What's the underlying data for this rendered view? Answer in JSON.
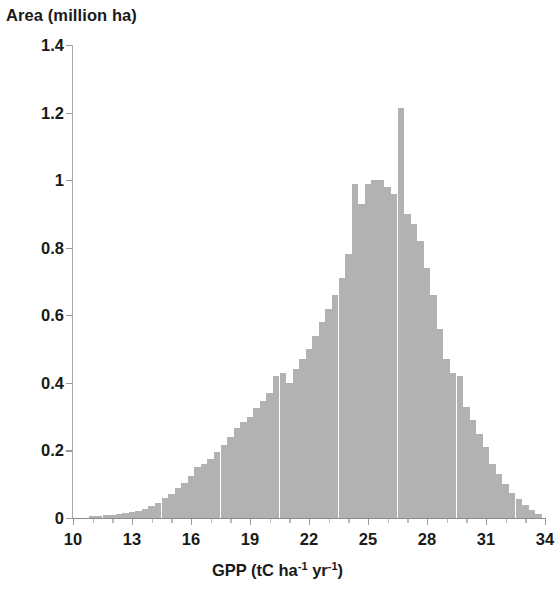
{
  "chart_data": {
    "type": "bar",
    "title": "",
    "subtitle": "",
    "ylabel": "Area (million ha)",
    "xlabel_parts": {
      "prefix": "GPP (tC ha",
      "sup1": "-1",
      "middle": " yr",
      "sup2": "-1",
      "suffix": ")"
    },
    "xlabel": "GPP (tC ha-1 yr-1)",
    "xlim": [
      10,
      34
    ],
    "ylim": [
      0,
      1.4
    ],
    "grid": false,
    "legend": null,
    "bar_color": "#b2b2b2",
    "bin_width": 0.3333,
    "xticks": [
      "10",
      "13",
      "16",
      "19",
      "22",
      "25",
      "28",
      "31",
      "34"
    ],
    "xtick_values": [
      10,
      13,
      16,
      19,
      22,
      25,
      28,
      31,
      34
    ],
    "yticks": [
      "0",
      "0.2",
      "0.4",
      "0.6",
      "0.8",
      "1",
      "1.2",
      "1.4"
    ],
    "ytick_values": [
      0,
      0.2,
      0.4,
      0.6,
      0.8,
      1.0,
      1.2,
      1.4
    ],
    "x": [
      11.0,
      11.33,
      11.67,
      12.0,
      12.33,
      12.67,
      13.0,
      13.33,
      13.67,
      14.0,
      14.33,
      14.67,
      15.0,
      15.33,
      15.67,
      16.0,
      16.33,
      16.67,
      17.0,
      17.33,
      17.67,
      18.0,
      18.33,
      18.67,
      19.0,
      19.33,
      19.67,
      20.0,
      20.33,
      20.67,
      21.0,
      21.33,
      21.67,
      22.0,
      22.33,
      22.67,
      23.0,
      23.33,
      23.67,
      24.0,
      24.33,
      24.67,
      25.0,
      25.33,
      25.67,
      26.0,
      26.33,
      26.67,
      27.0,
      27.33,
      27.67,
      28.0,
      28.33,
      28.67,
      29.0,
      29.33,
      29.67,
      30.0,
      30.33,
      30.67,
      31.0,
      31.33,
      31.67,
      32.0,
      32.33,
      32.67,
      33.0,
      33.33,
      33.67
    ],
    "values": [
      0.005,
      0.006,
      0.008,
      0.01,
      0.012,
      0.015,
      0.018,
      0.022,
      0.028,
      0.035,
      0.045,
      0.058,
      0.072,
      0.088,
      0.105,
      0.125,
      0.15,
      0.16,
      0.175,
      0.195,
      0.215,
      0.24,
      0.265,
      0.285,
      0.3,
      0.325,
      0.345,
      0.37,
      0.42,
      0.43,
      0.4,
      0.44,
      0.47,
      0.5,
      0.54,
      0.58,
      0.62,
      0.66,
      0.71,
      0.78,
      0.99,
      0.93,
      0.99,
      1.0,
      1.0,
      0.98,
      0.96,
      1.215,
      0.9,
      0.87,
      0.82,
      0.74,
      0.66,
      0.56,
      0.47,
      0.43,
      0.42,
      0.33,
      0.29,
      0.25,
      0.21,
      0.16,
      0.13,
      0.1,
      0.075,
      0.055,
      0.04,
      0.025,
      0.012
    ]
  }
}
